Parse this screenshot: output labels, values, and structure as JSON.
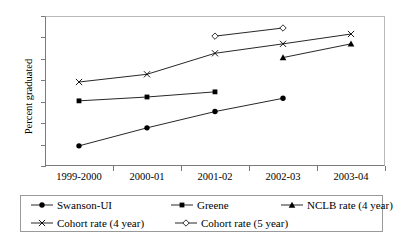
{
  "chart_data": {
    "type": "line",
    "title": "",
    "xlabel": "",
    "ylabel": "Percent graduated",
    "categories": [
      "1999-2000",
      "2000-01",
      "2001-02",
      "2002-03",
      "2003-04"
    ],
    "ylim": [
      50,
      85
    ],
    "yticks": [
      50,
      55,
      60,
      65,
      70,
      75,
      80,
      85
    ],
    "grid": false,
    "legend_position": "bottom",
    "series": [
      {
        "name": "Swanson-UI",
        "marker": "filled-circle",
        "values": [
          54.7,
          58.9,
          62.7,
          65.8,
          null
        ]
      },
      {
        "name": "Greene",
        "marker": "filled-square",
        "values": [
          65.2,
          66.1,
          67.3,
          null,
          null
        ]
      },
      {
        "name": "NCLB rate (4 year)",
        "marker": "filled-triangle",
        "values": [
          null,
          null,
          null,
          75.3,
          78.5
        ]
      },
      {
        "name": "Cohort rate (4 year)",
        "marker": "cross-x",
        "values": [
          69.6,
          71.4,
          76.3,
          78.5,
          80.8
        ]
      },
      {
        "name": "Cohort rate (5 year)",
        "marker": "open-diamond",
        "values": [
          null,
          null,
          80.3,
          82.2,
          null
        ]
      }
    ]
  },
  "axis": {
    "y_title": "Percent graduated",
    "y_tick_labels": [
      "50",
      "55",
      "60",
      "65",
      "70",
      "75",
      "80",
      "85"
    ],
    "x_tick_labels": [
      "1999-2000",
      "2000-01",
      "2001-02",
      "2002-03",
      "2003-04"
    ]
  },
  "legend": {
    "rows": [
      [
        {
          "label": "Swanson-UI",
          "marker": "filled-circle"
        },
        {
          "label": "Greene",
          "marker": "filled-square"
        },
        {
          "label": "NCLB rate (4 year)",
          "marker": "filled-triangle"
        }
      ],
      [
        {
          "label": "Cohort rate (4 year)",
          "marker": "cross-x"
        },
        {
          "label": "Cohort rate (5 year)",
          "marker": "open-diamond"
        }
      ]
    ]
  },
  "colors": {
    "ink": "#000000",
    "axis": "#7a7a7a",
    "frame_light": "#b9b9b9",
    "background": "#ffffff"
  }
}
